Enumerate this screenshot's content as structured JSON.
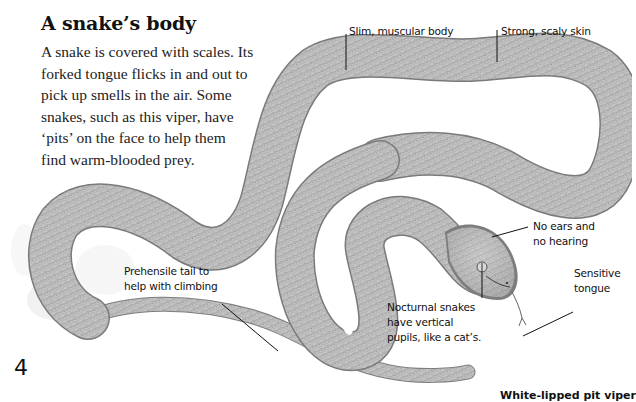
{
  "heading": {
    "title": "A snake’s body"
  },
  "intro": {
    "lines": [
      "A snake is covered with scales. Its",
      "forked tongue flicks in and out to",
      "pick up smells in the air. Some",
      "snakes, such as this viper, have",
      "‘pits’ on the face to help them",
      "find warm-blooded prey."
    ]
  },
  "labels": {
    "body": "Slim, muscular body",
    "skin": "Strong, scaly skin",
    "ears": [
      "No ears and",
      "no hearing"
    ],
    "tongue": [
      "Sensitive",
      "tongue"
    ],
    "tail": [
      "Prehensile tail to",
      "help with climbing"
    ],
    "pupils": [
      "Nocturnal snakes",
      "have vertical",
      "pupils, like a cat’s."
    ]
  },
  "species_name": "White-lipped pit viper",
  "page_number": "4",
  "colors": {
    "background": "#ffffff",
    "snake_fill": "#bdbdbd",
    "snake_shadow": "#8a8a8a",
    "text": "#111111"
  }
}
